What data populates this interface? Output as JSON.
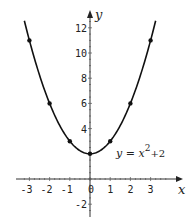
{
  "chart_data": {
    "type": "line",
    "title": "",
    "xlabel": "x",
    "ylabel": "y",
    "xlim": [
      -3.5,
      4
    ],
    "ylim": [
      -2.5,
      13
    ],
    "grid": false,
    "x_ticks": [
      -3,
      -2,
      -1,
      0,
      1,
      2,
      3
    ],
    "x_tick_labels": [
      "-3",
      "-2",
      "-1",
      "0",
      "1",
      "2",
      "3"
    ],
    "y_ticks": [
      -2,
      4,
      6,
      8,
      10,
      12
    ],
    "y_tick_labels": [
      "-2",
      "4",
      "6",
      "8",
      "10",
      "12"
    ],
    "series": [
      {
        "name": "y = x^2 + 2",
        "function": "x^2+2",
        "x_range": [
          -3.25,
          3.25
        ],
        "points": [
          {
            "x": -3,
            "y": 11
          },
          {
            "x": -2,
            "y": 6
          },
          {
            "x": -1,
            "y": 3
          },
          {
            "x": 0,
            "y": 2
          },
          {
            "x": 1,
            "y": 3
          },
          {
            "x": 2,
            "y": 6
          },
          {
            "x": 3,
            "y": 11
          }
        ]
      }
    ],
    "annotations": [
      {
        "text_base": "y = x",
        "superscript": "2",
        "text_tail": "+2",
        "x": 1.2,
        "y": 2.5
      }
    ]
  }
}
